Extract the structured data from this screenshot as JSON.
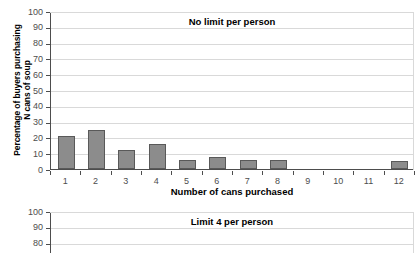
{
  "chart_data": [
    {
      "type": "bar",
      "title": "No limit per person",
      "xlabel": "Number of cans purchased",
      "ylabel": "Percentage of buyers purchasing\nN cans of soup",
      "categories": [
        "1",
        "2",
        "3",
        "4",
        "5",
        "6",
        "7",
        "8",
        "9",
        "10",
        "11",
        "12"
      ],
      "values": [
        21,
        25,
        12,
        16,
        5.5,
        7.5,
        5.5,
        5.5,
        0,
        0,
        0,
        5
      ],
      "ylim": [
        0,
        100
      ],
      "ytick_labels": [
        "100",
        "90",
        "80",
        "70",
        "60",
        "50",
        "40",
        "30",
        "20",
        "10",
        "0"
      ],
      "ytick_values": [
        100,
        90,
        80,
        70,
        60,
        50,
        40,
        30,
        20,
        10,
        0
      ],
      "grid": true,
      "legend": false,
      "bar_color": "#8c8c8c",
      "bar_edge_color": "#595959"
    },
    {
      "type": "bar",
      "title": "Limit 4 per person",
      "xlabel": "",
      "ylabel": "Percentage of buyers purchasing",
      "categories": [
        "1",
        "2",
        "3",
        "4",
        "5",
        "6",
        "7",
        "8",
        "9",
        "10",
        "11",
        "12"
      ],
      "values": [],
      "ylim": [
        0,
        100
      ],
      "ytick_labels": [
        "100",
        "90",
        "80"
      ],
      "ytick_values": [
        100,
        90,
        80
      ],
      "grid": true,
      "legend": false,
      "note": "panel cropped at image bottom edge",
      "bar_color": "#8c8c8c",
      "bar_edge_color": "#595959"
    }
  ],
  "panels": {
    "top": {
      "title": "No limit per person",
      "y_axis_title": "Percentage of buyers purchasing\nN cans of soup",
      "x_axis_title": "Number of cans purchased"
    },
    "bottom": {
      "title": "Limit 4 per person",
      "y_axis_title": "urchasing"
    }
  },
  "colors": {
    "bar_fill": "#8c8c8c",
    "bar_stroke": "#595959",
    "axis": "#4d4d4d",
    "grid": "#d9d9d9",
    "text": "#000000",
    "tick_text": "#4d4d4d",
    "background": "#ffffff"
  }
}
